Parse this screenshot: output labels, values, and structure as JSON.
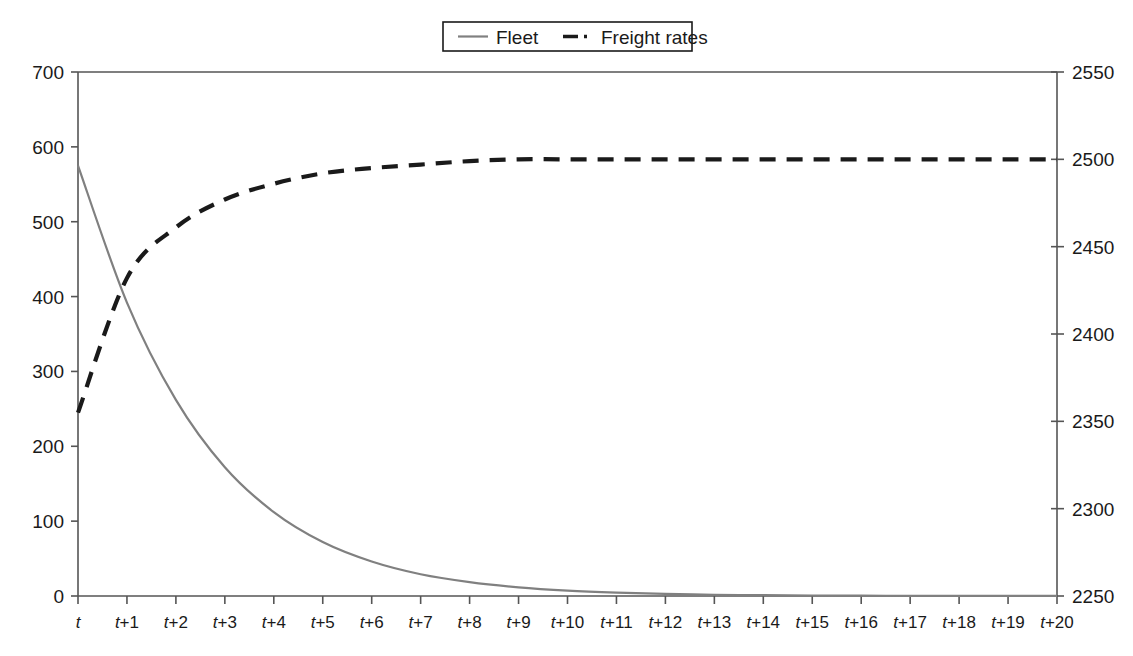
{
  "chart_data": {
    "type": "line",
    "title": "",
    "subtitle": "",
    "xlabel": "",
    "grid": false,
    "legend_position": "top-center",
    "x": [
      "t",
      "t+1",
      "t+2",
      "t+3",
      "t+4",
      "t+5",
      "t+6",
      "t+7",
      "t+8",
      "t+9",
      "t+10",
      "t+11",
      "t+12",
      "t+13",
      "t+14",
      "t+15",
      "t+16",
      "t+17",
      "t+18",
      "t+19",
      "t+20"
    ],
    "xtick_labels": [
      "t",
      "t+1",
      "t+2",
      "t+3",
      "t+4",
      "t+5",
      "t+6",
      "t+7",
      "t+8",
      "t+9",
      "t+10",
      "t+11",
      "t+12",
      "t+13",
      "t+14",
      "t+15",
      "t+16",
      "t+17",
      "t+18",
      "t+19",
      "t+20"
    ],
    "axes": [
      {
        "id": "left",
        "label": "",
        "ylim": [
          0,
          700
        ],
        "ytick_labels": [
          "0",
          "100",
          "200",
          "300",
          "400",
          "500",
          "600",
          "700"
        ],
        "yticks": [
          0,
          100,
          200,
          300,
          400,
          500,
          600,
          700
        ]
      },
      {
        "id": "right",
        "label": "",
        "ylim": [
          2250,
          2550
        ],
        "ytick_labels": [
          "2250",
          "2300",
          "2350",
          "2400",
          "2450",
          "2500",
          "2550"
        ],
        "yticks": [
          2250,
          2300,
          2350,
          2400,
          2450,
          2500,
          2550
        ]
      }
    ],
    "series": [
      {
        "name": "Fleet",
        "axis": "left",
        "color": "#808080",
        "linestyle": "solid",
        "values": [
          575,
          392,
          262,
          172,
          112,
          72,
          46,
          29,
          18.5,
          11.6,
          7.2,
          4.5,
          2.8,
          1.7,
          1.1,
          0.7,
          0.4,
          0.25,
          0.16,
          0.1,
          0.06
        ]
      },
      {
        "name": "Freight rates",
        "axis": "right",
        "color": "#1a1a1a",
        "linestyle": "dashed",
        "values": [
          2355,
          2432,
          2461,
          2477,
          2486,
          2492,
          2495,
          2497,
          2499,
          2500,
          2500,
          2500,
          2500,
          2500,
          2500,
          2500,
          2500,
          2500,
          2500,
          2500,
          2500
        ]
      }
    ],
    "legend": [
      {
        "label": "Fleet",
        "color": "#808080",
        "linestyle": "solid"
      },
      {
        "label": "Freight rates",
        "color": "#1a1a1a",
        "linestyle": "dash-dot"
      }
    ]
  }
}
